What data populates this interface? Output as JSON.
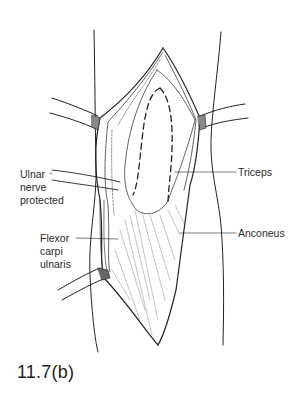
{
  "figure": {
    "caption": "11.7(b)",
    "labels": {
      "ulnar_nerve": [
        "Ulnar",
        "nerve",
        "protected"
      ],
      "flexor": [
        "Flexor",
        "carpi",
        "ulnaris"
      ],
      "triceps": "Triceps",
      "anconeus": "Anconeus"
    },
    "colors": {
      "ink": "#222222",
      "background": "#ffffff"
    }
  }
}
